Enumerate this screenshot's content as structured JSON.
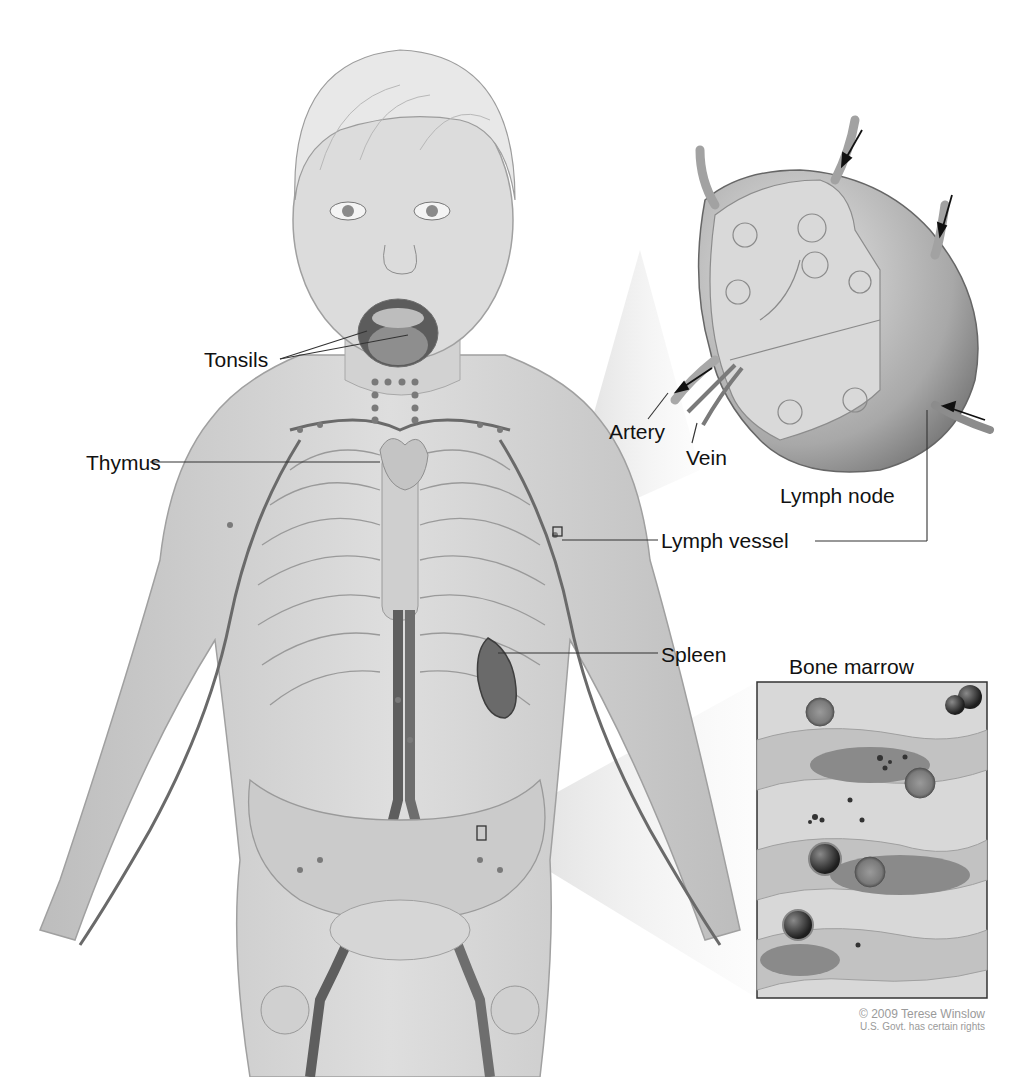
{
  "figure": {
    "style": "grayscale medical illustration"
  },
  "labels": {
    "tonsils": "Tonsils",
    "thymus": "Thymus",
    "artery": "Artery",
    "vein": "Vein",
    "lymph_node": "Lymph node",
    "lymph_vessel": "Lymph vessel",
    "spleen": "Spleen",
    "bone_marrow": "Bone marrow"
  },
  "insets": [
    {
      "name": "lymph-node-cross-section",
      "title": "Lymph node"
    },
    {
      "name": "bone-marrow-detail",
      "title": "Bone marrow"
    }
  ],
  "copyright": {
    "line1": "© 2009 Terese Winslow",
    "line2": "U.S. Govt. has certain rights"
  },
  "colors": {
    "background": "#ffffff",
    "skin": "#d4d4d4",
    "vessel": "#6a6a6a",
    "label_text": "#111111",
    "leader_line": "#333333",
    "copyright_text": "#9a9a9a"
  }
}
